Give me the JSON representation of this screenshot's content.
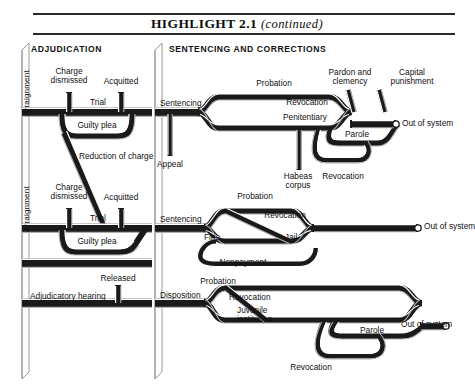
{
  "header": {
    "title": "HIGHLIGHT  2.1",
    "continued": "(continued)"
  },
  "columns": [
    {
      "id": "adjudication",
      "label": "ADJUDICATION"
    },
    {
      "id": "sentencing-and-corrections",
      "label": "SENTENCING AND CORRECTIONS"
    }
  ],
  "stage_labels": {
    "arraignment_felony": "Arraignment",
    "arraignment_misdemeanor": "Arraignment",
    "charge_dismissed_felony": "Charge\ndismissed",
    "acquitted_felony": "Acquitted",
    "trial_felony": "Trial",
    "guilty_plea_felony": "Guilty plea",
    "reduction_of_charge": "Reduction of charge",
    "charge_dismissed_misd": "Charge\ndismissed",
    "acquitted_misd": "Acquitted",
    "trial_misd": "Trial",
    "guilty_plea_misd": "Guilty plea",
    "adjudicatory_hearing": "Adjudicatory hearing",
    "released": "Released"
  },
  "flow_labels": {
    "sentencing_felony": "Sentencing",
    "appeal": "Appeal",
    "probation_felony": "Probation",
    "revocation_felony": "Revocation",
    "penitentiary": "Penitentiary",
    "habeas_corpus": "Habeas\ncorpus",
    "revocation_parole_felony": "Revocation",
    "pardon_and_clemency": "Pardon and\nclemency",
    "capital_punishment": "Capital\npunishment",
    "parole_felony": "Parole",
    "out_of_system_felony": "Out of system",
    "sentencing_misd": "Sentencing",
    "probation_misd": "Probation",
    "revocation_misd": "Revocation",
    "fine": "Fine",
    "jail": "Jail",
    "nonpayment": "Nonpayment",
    "out_of_system_misd": "Out of system",
    "disposition": "Disposition",
    "probation_juv": "Probation",
    "revocation_juv": "Revocation",
    "juvenile_institution": "Juvenile\ninstitution",
    "parole_juv": "Parole",
    "revocation_parole_juv": "Revocation",
    "out_of_system_juv": "Out of system"
  },
  "colors": {
    "pipe": "#1a1a1a",
    "pipe_highlight": "#ffffff",
    "pipe_shadow": "#b8b8b8",
    "text": "#101010",
    "rule": "#2b2b2b",
    "background": "#ffffff"
  }
}
